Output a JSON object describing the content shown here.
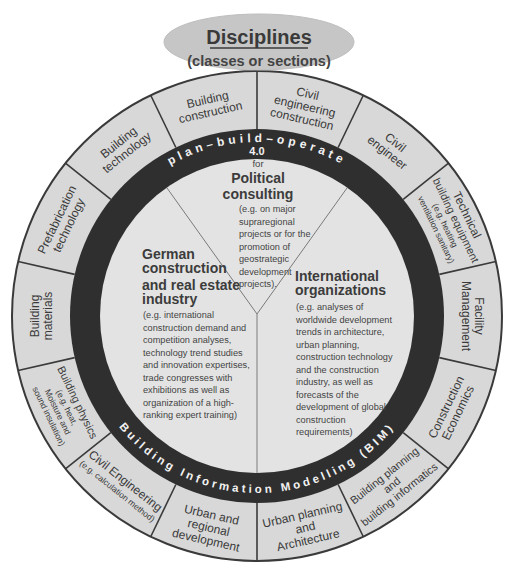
{
  "header": {
    "title": "Disciplines",
    "subtitle": "(classes or sections)"
  },
  "bands": {
    "top": "plan–build–operate",
    "top_sub": "4.0",
    "bottom": "Building Information Modelling (BIM)"
  },
  "sectors": {
    "political": {
      "for": "for",
      "title_lines": [
        "Political",
        "consulting"
      ],
      "desc_lines": [
        "(e.g. on major",
        "supraregional",
        "projects or for the",
        "promotion of",
        "geostrategic",
        "development",
        "projects)."
      ]
    },
    "german": {
      "title_lines": [
        "German",
        "construction",
        "and real estate",
        "industry"
      ],
      "desc_lines": [
        "(e.g. international",
        "construction demand and",
        "competition analyses,",
        "technology trend studies",
        "and innovation expertises,",
        "trade congresses with",
        "exhibitions as well as",
        "organization of a high-",
        "ranking expert training)"
      ]
    },
    "international": {
      "title_lines": [
        "International",
        "organizations"
      ],
      "desc_lines": [
        "(e.g. analyses of",
        "worldwide development",
        "trends in architecture,",
        "urban planning,",
        "construction technology",
        "and the construction",
        "industry, as well as",
        "forecasts of the",
        "development of global",
        "construction",
        "requirements)"
      ]
    }
  },
  "disciplines": [
    {
      "lines": [
        "Building",
        "construction"
      ]
    },
    {
      "lines": [
        "Civil",
        "engineering",
        "construction"
      ]
    },
    {
      "lines": [
        "Civil",
        "engineer"
      ]
    },
    {
      "lines": [
        "Technical",
        "building equipment",
        "(e.g. heating",
        "ventilation sanitary)"
      ]
    },
    {
      "lines": [
        "Facility",
        "Management"
      ]
    },
    {
      "lines": [
        "Construction",
        "Economics"
      ]
    },
    {
      "lines": [
        "Building planning",
        "and",
        "building informatics"
      ]
    },
    {
      "lines": [
        "Urban planning",
        "and",
        "Architecture"
      ]
    },
    {
      "lines": [
        "Urban and",
        "regional",
        "development"
      ]
    },
    {
      "lines": [
        "Civil Engineering",
        "(e.g. calculation method)"
      ]
    },
    {
      "lines": [
        "Building physics",
        "(e.g. heat,",
        "Moisture and",
        "sound insulation)"
      ]
    },
    {
      "lines": [
        "Building",
        "materials"
      ]
    },
    {
      "lines": [
        "Prefabrication",
        "technology"
      ]
    },
    {
      "lines": [
        "Building",
        "technology"
      ]
    }
  ],
  "colors": {
    "outer_ring": "#d8d8d8",
    "dark_band": "#2f2f2f",
    "inner_disc": "#e3e3e3",
    "ellipse": "#c6c6c6",
    "stroke": "#3a3a3a"
  }
}
